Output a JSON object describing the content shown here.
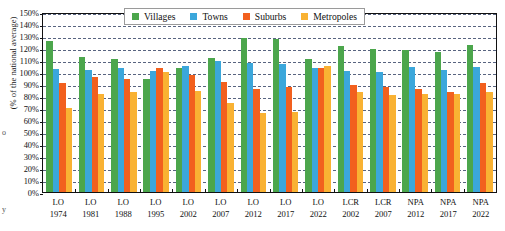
{
  "chart_data": {
    "type": "bar",
    "title": "",
    "xlabel": "",
    "ylabel": "(% of the national average)",
    "ylim": [
      0,
      150
    ],
    "ytick_step": 10,
    "grid": true,
    "legend_position": "top-center",
    "ytick_labels": [
      "150%",
      "140%",
      "130%",
      "120%",
      "110%",
      "100%",
      "90%",
      "80%",
      "70%",
      "60%",
      "50%",
      "40%",
      "30%",
      "20%",
      "10%",
      "0%"
    ],
    "categories": [
      {
        "line1": "LO",
        "line2": "1974"
      },
      {
        "line1": "LO",
        "line2": "1981"
      },
      {
        "line1": "LO",
        "line2": "1988"
      },
      {
        "line1": "LO",
        "line2": "1995"
      },
      {
        "line1": "LO",
        "line2": "2002"
      },
      {
        "line1": "LO",
        "line2": "2007"
      },
      {
        "line1": "LO",
        "line2": "2012"
      },
      {
        "line1": "LO",
        "line2": "2017"
      },
      {
        "line1": "LO",
        "line2": "2022"
      },
      {
        "line1": "LCR",
        "line2": "2002"
      },
      {
        "line1": "LCR",
        "line2": "2007"
      },
      {
        "line1": "NPA",
        "line2": "2012"
      },
      {
        "line1": "NPA",
        "line2": "2017"
      },
      {
        "line1": "NPA",
        "line2": "2022"
      }
    ],
    "series": [
      {
        "name": "Villages",
        "color": "#4ca64c",
        "values": [
          125.5,
          112.5,
          110.5,
          94.5,
          103.5,
          112.0,
          128.0,
          127.5,
          110.5,
          122.0,
          119.5,
          118.0,
          117.0,
          122.5
        ]
      },
      {
        "name": "Towns",
        "color": "#3ba7db",
        "values": [
          102.5,
          102.0,
          103.5,
          100.5,
          105.0,
          109.0,
          107.5,
          106.5,
          103.5,
          100.5,
          100.0,
          104.0,
          101.5,
          104.0
        ]
      },
      {
        "name": "Suburbs",
        "color": "#f2601e",
        "values": [
          90.5,
          96.0,
          94.0,
          103.5,
          97.5,
          92.0,
          86.0,
          87.5,
          103.0,
          89.0,
          87.5,
          85.5,
          83.5,
          90.5
        ]
      },
      {
        "name": "Metropoles",
        "color": "#f9b233",
        "values": [
          70.0,
          82.0,
          83.5,
          100.0,
          84.0,
          74.5,
          66.0,
          67.0,
          105.0,
          83.0,
          80.5,
          81.5,
          82.0,
          83.0
        ]
      }
    ]
  },
  "legend": {
    "items": [
      {
        "label": "Villages",
        "swatch": "villages-swatch"
      },
      {
        "label": "Towns",
        "swatch": "towns-swatch"
      },
      {
        "label": "Suburbs",
        "swatch": "suburbs-swatch"
      },
      {
        "label": "Metropoles",
        "swatch": "metropoles-swatch"
      }
    ]
  },
  "axis": {
    "y_label": "(% of the national average)"
  },
  "margin_marks": {
    "left_mid": "o",
    "left_bottom": "y"
  }
}
